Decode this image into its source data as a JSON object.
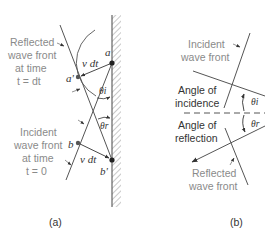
{
  "panel_a": {
    "caption": "(a)",
    "reflected_label": [
      "Reflected",
      "wave front",
      "at time",
      "t = dt"
    ],
    "incident_label": [
      "Incident",
      "wave front",
      "at time",
      "t = 0"
    ],
    "point_a": "a",
    "point_a_prime": "a'",
    "point_b": "b",
    "point_b_prime": "b'",
    "vdt_top": "v dt",
    "vdt_bottom": "v dt",
    "theta_i": "θi",
    "theta_r": "θr"
  },
  "panel_b": {
    "caption": "(b)",
    "incident_label": [
      "Incident",
      "wave front"
    ],
    "angle_incidence_label": [
      "Angle of",
      "incidence"
    ],
    "angle_reflection_label": [
      "Angle of",
      "reflection"
    ],
    "reflected_label": [
      "Reflected",
      "wave front"
    ],
    "theta_i": "θi",
    "theta_r": "θr"
  },
  "colors": {
    "line": "#555555",
    "label_gray": "#8a8a8a",
    "text_dark": "#333333"
  }
}
